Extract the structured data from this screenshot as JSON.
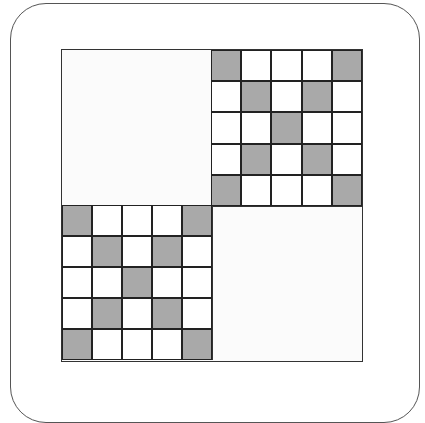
{
  "figure": {
    "colors": {
      "shaded": "#a9a9a9",
      "empty": "#ffffff",
      "line": "#222222"
    },
    "pattern": [
      [
        1,
        0,
        0,
        0,
        1
      ],
      [
        0,
        1,
        0,
        1,
        0
      ],
      [
        0,
        0,
        1,
        0,
        0
      ],
      [
        0,
        1,
        0,
        1,
        0
      ],
      [
        1,
        0,
        0,
        0,
        1
      ]
    ],
    "quadrants": {
      "top_left": "blank",
      "top_right": "grid",
      "bottom_left": "grid",
      "bottom_right": "blank"
    }
  }
}
